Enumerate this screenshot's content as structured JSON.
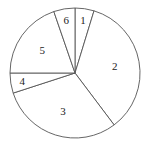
{
  "chart_data": {
    "type": "pie",
    "title": "",
    "categories": [
      "1",
      "2",
      "3",
      "4",
      "5",
      "6"
    ],
    "values": [
      17,
      126,
      109,
      18,
      71,
      19
    ],
    "units": "degrees",
    "percent": [
      4.7,
      35.0,
      30.3,
      5.0,
      19.7,
      5.3
    ],
    "start_angle": "12 o'clock",
    "direction": "clockwise",
    "legend": "none",
    "labels_inside": true,
    "fill": "#ffffff",
    "stroke": "#555555"
  }
}
